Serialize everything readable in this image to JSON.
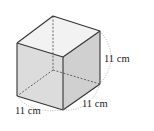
{
  "figure": {
    "type": "cube",
    "edge_length": 11,
    "unit": "cm",
    "labels": {
      "height": "11 cm",
      "depth": "11 cm",
      "width": "11 cm"
    },
    "colors": {
      "edge": "#333333",
      "hidden_edge": "#555555",
      "top_face": "#f2f2f2",
      "front_face": "#dcdcdc",
      "side_face": "#cfcfcf",
      "dimension_arc": "#999999",
      "background": "#ffffff"
    }
  }
}
